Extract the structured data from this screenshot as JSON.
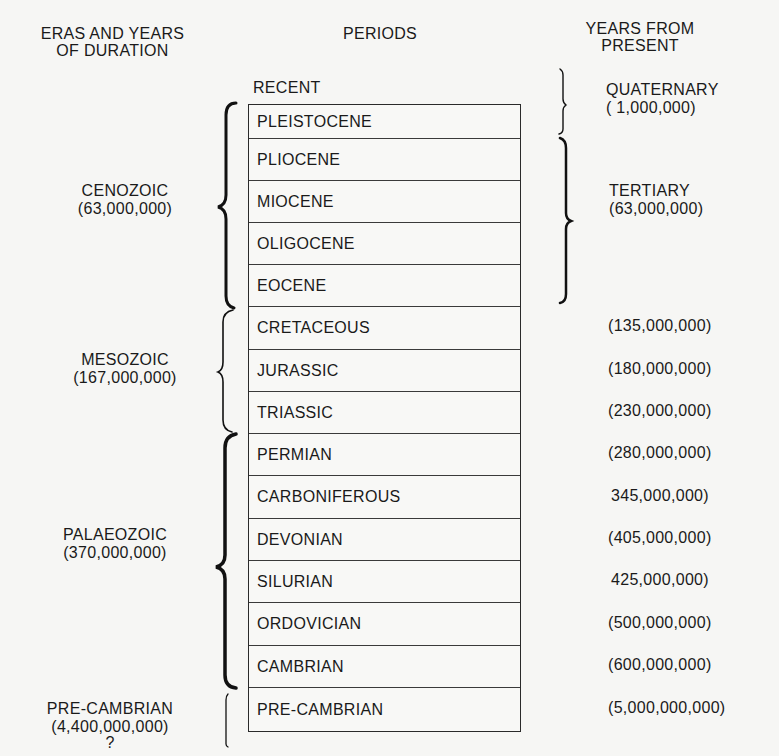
{
  "headers": {
    "eras": [
      "ERAS AND YEARS",
      "OF DURATION"
    ],
    "periods": "PERIODS",
    "years": [
      "YEARS FROM",
      "PRESENT"
    ]
  },
  "recent_label": "RECENT",
  "eras": [
    {
      "name": "CENOZOIC",
      "duration": "(63,000,000)"
    },
    {
      "name": "MESOZOIC",
      "duration": "(167,000,000)"
    },
    {
      "name": "PALAEOZOIC",
      "duration": "(370,000,000)"
    },
    {
      "name": "PRE-CAMBRIAN",
      "duration": "(4,400,000,000)",
      "note": "?"
    }
  ],
  "periods": [
    {
      "name": "PLEISTOCENE",
      "years": ""
    },
    {
      "name": "PLIOCENE",
      "years": ""
    },
    {
      "name": "MIOCENE",
      "years": ""
    },
    {
      "name": "OLIGOCENE",
      "years": ""
    },
    {
      "name": "EOCENE",
      "years": ""
    },
    {
      "name": "CRETACEOUS",
      "years": "(135,000,000)"
    },
    {
      "name": "JURASSIC",
      "years": "(180,000,000)"
    },
    {
      "name": "TRIASSIC",
      "years": "(230,000,000)"
    },
    {
      "name": "PERMIAN",
      "years": "(280,000,000)"
    },
    {
      "name": "CARBONIFEROUS",
      "years": "345,000,000)"
    },
    {
      "name": "DEVONIAN",
      "years": "(405,000,000)"
    },
    {
      "name": "SILURIAN",
      "years": "425,000,000)"
    },
    {
      "name": "ORDOVICIAN",
      "years": "(500,000,000)"
    },
    {
      "name": "CAMBRIAN",
      "years": "(600,000,000)"
    },
    {
      "name": "PRE-CAMBRIAN",
      "years": "(5,000,000,000)"
    }
  ],
  "sub_eras": [
    {
      "name": "QUATERNARY",
      "years": "( 1,000,000)"
    },
    {
      "name": "TERTIARY",
      "years": "(63,000,000)"
    }
  ]
}
